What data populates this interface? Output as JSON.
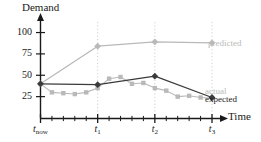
{
  "chart_data": {
    "type": "line",
    "title": "",
    "ylabel": "Demand",
    "xlabel": "Time",
    "ylim": [
      0,
      110
    ],
    "yticks": [
      25,
      50,
      75,
      100
    ],
    "ytick_labels": [
      "25",
      "50",
      "75",
      "100"
    ],
    "xlim": [
      0,
      3
    ],
    "xticks": [
      0,
      1,
      2,
      3
    ],
    "xtick_labels": [
      "t_now",
      "t_1",
      "t_2",
      "t_3"
    ],
    "xtick_label_parts": [
      {
        "base": "t",
        "sub": "now"
      },
      {
        "base": "t",
        "sub": "1"
      },
      {
        "base": "t",
        "sub": "2"
      },
      {
        "base": "t",
        "sub": "3"
      }
    ],
    "minor_ticks_per_interval": 5,
    "grid": "vertical dotted gridlines at labeled x ticks only",
    "legend": "inline labels at right end of each series",
    "series": [
      {
        "name": "predicted",
        "color": "#b9b9b9",
        "marker": "diamond",
        "x": [
          0,
          1,
          2,
          3
        ],
        "values": [
          40,
          84,
          89,
          88
        ]
      },
      {
        "name": "actual",
        "color": "#b9b9b9",
        "marker": "square",
        "x": [
          0,
          0.2,
          0.4,
          0.6,
          0.8,
          1,
          1.2,
          1.4,
          1.6,
          1.8,
          2,
          2.2,
          2.4,
          2.6,
          2.8,
          3
        ],
        "values": [
          40,
          30,
          29,
          28,
          30,
          35,
          46,
          48,
          40,
          41,
          35,
          32,
          25,
          26,
          24,
          23
        ]
      },
      {
        "name": "expected",
        "color": "#3b3b3b",
        "marker": "diamond",
        "x": [
          0,
          1,
          2,
          3
        ],
        "values": [
          40,
          39,
          49,
          24
        ]
      }
    ],
    "annotations": [
      {
        "text": "predicted",
        "series": "predicted",
        "color": "#b9b9b9"
      },
      {
        "text": "actual",
        "series": "actual",
        "color": "#b9b9b9"
      },
      {
        "text": "expected",
        "series": "expected",
        "color": "#1a1a1a"
      }
    ]
  },
  "axes": {
    "y_title": "Demand",
    "x_title": "Time"
  }
}
